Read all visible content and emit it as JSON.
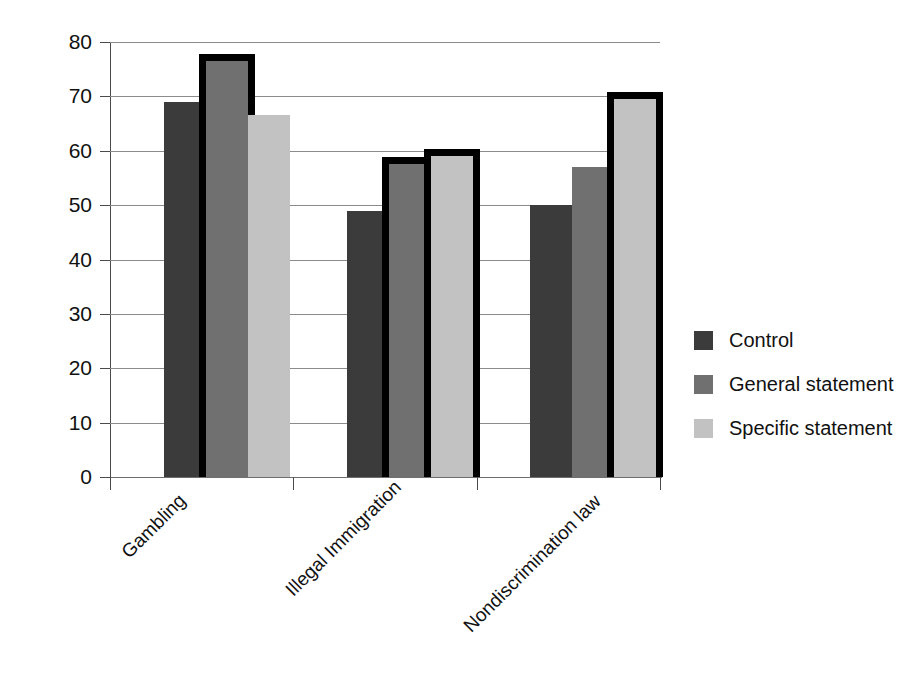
{
  "chart_data": {
    "type": "bar",
    "title": "",
    "xlabel": "",
    "ylabel": "Support for LDS Church position",
    "ylim": [
      0,
      80
    ],
    "ytick_labels": [
      "80",
      "70",
      "60",
      "50",
      "40",
      "30",
      "20",
      "10",
      "0"
    ],
    "ytick_values": [
      80,
      70,
      60,
      50,
      40,
      30,
      20,
      10,
      0
    ],
    "grid": true,
    "legend_position": "right",
    "categories": [
      "Gambling",
      "Illegal Immigration",
      "Nondiscrimination law"
    ],
    "series": [
      {
        "name": "Control",
        "color": "#3b3b3b",
        "values": [
          69,
          49,
          50
        ]
      },
      {
        "name": "General statement",
        "color": "#707070",
        "values": [
          76.5,
          57.5,
          57
        ]
      },
      {
        "name": "Specific statement",
        "color": "#c2c2c2",
        "values": [
          66.5,
          59,
          69.5
        ]
      }
    ],
    "highlighted_bars": [
      {
        "category": "Gambling",
        "series": "General statement"
      },
      {
        "category": "Illegal Immigration",
        "series": "General statement"
      },
      {
        "category": "Illegal Immigration",
        "series": "Specific statement"
      },
      {
        "category": "Nondiscrimination law",
        "series": "Specific statement"
      }
    ],
    "highlight_outline_color": "#000000"
  },
  "legend": {
    "items": [
      {
        "label": "Control",
        "color": "#3b3b3b"
      },
      {
        "label": "General statement",
        "color": "#707070"
      },
      {
        "label": "Specific statement",
        "color": "#c2c2c2"
      }
    ]
  }
}
